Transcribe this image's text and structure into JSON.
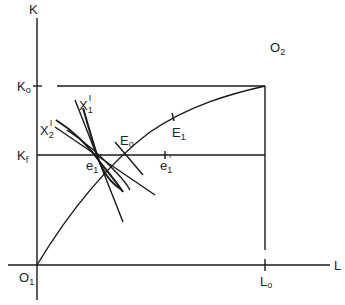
{
  "diagram": {
    "type": "edgeworth-box",
    "axes": {
      "y_label": "K",
      "x_label": "L"
    },
    "points": {
      "origin1": {
        "main": "O",
        "sub": "1"
      },
      "origin2": {
        "main": "O",
        "sub": "2"
      },
      "k0": {
        "main": "K",
        "sub": "o"
      },
      "kf": {
        "main": "K",
        "sub": "f"
      },
      "l0": {
        "main": "L",
        "sub": "o"
      },
      "e0": {
        "main": "E",
        "sub": "o"
      },
      "e1_upper": {
        "main": "E",
        "sub": "1"
      },
      "e1_lower": {
        "main": "e",
        "sub": "1"
      },
      "e1_prime": {
        "main": "e",
        "sub": "1",
        "sup": "'"
      },
      "x1_prime": {
        "main": "X",
        "sub": "1",
        "sup": "I"
      },
      "x2_prime": {
        "main": "X",
        "sub": "2",
        "sup": "I"
      }
    },
    "colors": {
      "line": "#1a1a1a",
      "background": "#ffffff"
    }
  }
}
